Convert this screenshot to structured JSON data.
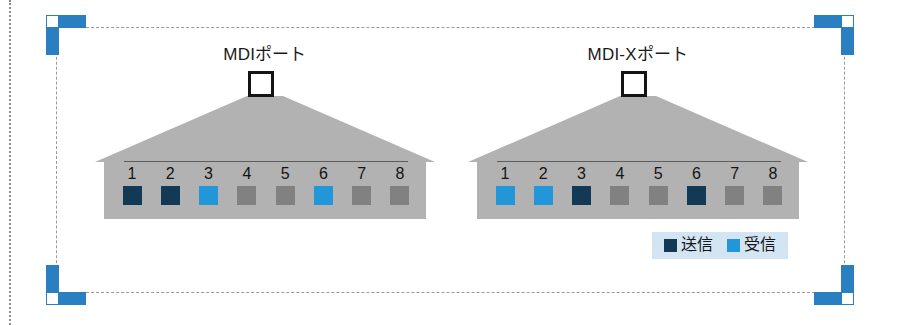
{
  "colors": {
    "transmit": "#123a56",
    "receive": "#2196d8",
    "inactive_pin": "#818181",
    "fan_gray": "#b2b2b2",
    "port_bar_gray": "#b2b2b2",
    "handle_blue": "#2a7fc1",
    "legend_background": "#d3e4f3",
    "selection_border": "#9a9a9a"
  },
  "diagrams": [
    {
      "id": "mdi",
      "title": "MDIポート",
      "connector": "rj45-connector",
      "pins": [
        {
          "number": "1",
          "state": "transmit"
        },
        {
          "number": "2",
          "state": "transmit"
        },
        {
          "number": "3",
          "state": "receive"
        },
        {
          "number": "4",
          "state": "inactive"
        },
        {
          "number": "5",
          "state": "inactive"
        },
        {
          "number": "6",
          "state": "receive"
        },
        {
          "number": "7",
          "state": "inactive"
        },
        {
          "number": "8",
          "state": "inactive"
        }
      ]
    },
    {
      "id": "mdix",
      "title": "MDI-Xポート",
      "connector": "rj45-connector",
      "pins": [
        {
          "number": "1",
          "state": "receive"
        },
        {
          "number": "2",
          "state": "receive"
        },
        {
          "number": "3",
          "state": "transmit"
        },
        {
          "number": "4",
          "state": "inactive"
        },
        {
          "number": "5",
          "state": "inactive"
        },
        {
          "number": "6",
          "state": "transmit"
        },
        {
          "number": "7",
          "state": "inactive"
        },
        {
          "number": "8",
          "state": "inactive"
        }
      ]
    }
  ],
  "legend": {
    "entries": [
      {
        "label": "送信",
        "state": "transmit"
      },
      {
        "label": "受信",
        "state": "receive"
      }
    ]
  },
  "selection": {
    "handles": [
      {
        "name": "top-left"
      },
      {
        "name": "top-right"
      },
      {
        "name": "bottom-left"
      },
      {
        "name": "bottom-right"
      }
    ]
  }
}
